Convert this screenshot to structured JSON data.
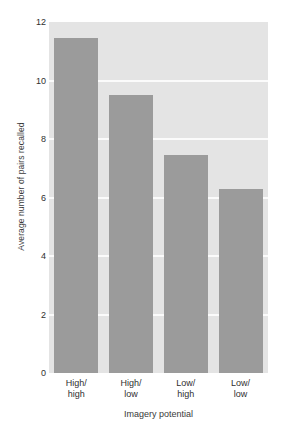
{
  "chart_data": {
    "type": "bar",
    "title": "",
    "xlabel": "Imagery potential",
    "ylabel": "Average number of pairs recalled",
    "categories": [
      "High/high",
      "High/low",
      "Low/high",
      "Low/low"
    ],
    "category_lines": [
      [
        "High/",
        "high"
      ],
      [
        "High/",
        "low"
      ],
      [
        "Low/",
        "high"
      ],
      [
        "Low/",
        "low"
      ]
    ],
    "values": [
      11.45,
      9.5,
      7.45,
      6.3
    ],
    "ylim": [
      0,
      12
    ],
    "yticks": [
      0,
      2,
      4,
      6,
      8,
      10,
      12
    ],
    "ytick_labels": [
      "0",
      "2",
      "4",
      "6",
      "8",
      "10",
      "12"
    ],
    "grid": true,
    "grid_axis": "y",
    "legend": false,
    "legend_position": "none",
    "colors": {
      "bar": "#9b9b9b",
      "plot_background": "#e4e4e4",
      "gridline": "#fbfbfb",
      "figure_background": "#ffffff",
      "text": "#2f2f2f"
    }
  }
}
